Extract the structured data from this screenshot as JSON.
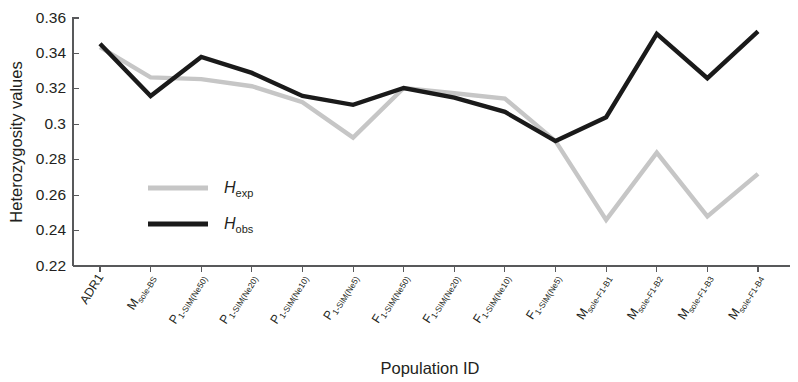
{
  "chart_data": {
    "type": "line",
    "title": "",
    "xlabel": "Population ID",
    "ylabel": "Heterozygosity values",
    "ylim": [
      0.22,
      0.36
    ],
    "yticks": [
      "0.22",
      "0.24",
      "0.26",
      "0.28",
      "0.3",
      "0.32",
      "0.34",
      "0.36"
    ],
    "ytick_values": [
      0.22,
      0.24,
      0.26,
      0.28,
      0.3,
      0.32,
      0.34,
      0.36
    ],
    "grid": false,
    "legend_position": "inside-left",
    "categories": [
      "ADR1",
      "Msole-BS",
      "P1-SIM(Ne50)",
      "P1-SIM(Ne20)",
      "P1-SIM(Ne10)",
      "P1-SIM(Ne5)",
      "F1-SIM(Ne50)",
      "F1-SIM(Ne20)",
      "F1-SIM(Ne10)",
      "F1-SIM(Ne5)",
      "Msole-F1-B1",
      "Msole-F1-B2",
      "Msole-F1-B3",
      "Msole-F1-B4"
    ],
    "categories_parts": [
      {
        "base": "ADR1",
        "sub": ""
      },
      {
        "base": "M",
        "sub": "sole-BS"
      },
      {
        "base": "P",
        "sub": "1-SIM(Ne50)"
      },
      {
        "base": "P",
        "sub": "1-SIM(Ne20)"
      },
      {
        "base": "P",
        "sub": "1-SIM(Ne10)"
      },
      {
        "base": "P",
        "sub": "1-SIM(Ne5)"
      },
      {
        "base": "F",
        "sub": "1-SIM(Ne50)"
      },
      {
        "base": "F",
        "sub": "1-SIM(Ne20)"
      },
      {
        "base": "F",
        "sub": "1-SIM(Ne10)"
      },
      {
        "base": "F",
        "sub": "1-SIM(Ne5)"
      },
      {
        "base": "M",
        "sub": "sole-F1-B1"
      },
      {
        "base": "M",
        "sub": "sole-F1-B2"
      },
      {
        "base": "M",
        "sub": "sole-F1-B3"
      },
      {
        "base": "M",
        "sub": "sole-F1-B4"
      }
    ],
    "series": [
      {
        "name": "Hexp",
        "name_base": "H",
        "name_sub": "exp",
        "color": "#c6c6c6",
        "width": 4.4,
        "values": [
          0.3435,
          0.3265,
          0.3255,
          0.3215,
          0.3125,
          0.2925,
          0.3205,
          0.3175,
          0.3145,
          0.2905,
          0.246,
          0.284,
          0.248,
          0.272
        ]
      },
      {
        "name": "Hobs",
        "name_base": "H",
        "name_sub": "obs",
        "color": "#1a1a1a",
        "width": 4.4,
        "values": [
          0.3455,
          0.316,
          0.338,
          0.329,
          0.316,
          0.311,
          0.3205,
          0.315,
          0.307,
          0.2905,
          0.304,
          0.351,
          0.326,
          0.3525
        ]
      }
    ]
  },
  "legend": {
    "entries": [
      {
        "label_base": "H",
        "label_sub": "exp",
        "color": "#c6c6c6"
      },
      {
        "label_base": "H",
        "label_sub": "obs",
        "color": "#1a1a1a"
      }
    ]
  },
  "axes": {
    "x_title": "Population ID",
    "y_title": "Heterozygosity values"
  }
}
